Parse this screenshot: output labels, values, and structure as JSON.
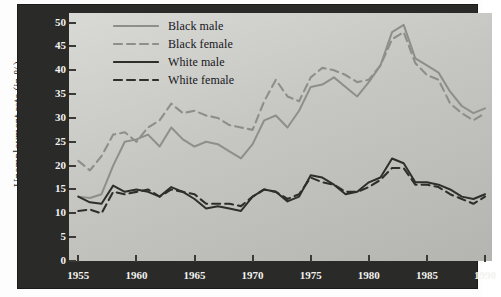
{
  "chart_data": {
    "type": "line",
    "title": "",
    "xlabel": "",
    "ylabel": "Unemployment rate (in %)",
    "xlim": [
      1954.2,
      1990.6
    ],
    "ylim": [
      0,
      52
    ],
    "xticks": [
      1955,
      1960,
      1965,
      1970,
      1975,
      1980,
      1985,
      1990
    ],
    "yticks": [
      0,
      5,
      10,
      15,
      20,
      25,
      30,
      35,
      40,
      45,
      50
    ],
    "grid": false,
    "legend_position": "top-left-inside",
    "x": [
      1955,
      1956,
      1957,
      1958,
      1959,
      1960,
      1961,
      1962,
      1963,
      1964,
      1965,
      1966,
      1967,
      1968,
      1969,
      1970,
      1971,
      1972,
      1973,
      1974,
      1975,
      1976,
      1977,
      1978,
      1979,
      1980,
      1981,
      1982,
      1983,
      1984,
      1985,
      1986,
      1987,
      1988,
      1989,
      1990
    ],
    "series": [
      {
        "name": "Black male",
        "color": "#8e8e8b",
        "style": "solid",
        "values": [
          13.5,
          13.2,
          14.0,
          20.0,
          25.0,
          25.5,
          26.5,
          24.0,
          28.0,
          25.5,
          24.0,
          25.0,
          24.5,
          23.0,
          21.5,
          24.5,
          29.5,
          30.5,
          28.0,
          31.5,
          36.5,
          37.0,
          38.5,
          36.5,
          34.5,
          37.5,
          41.0,
          48.0,
          49.5,
          42.5,
          41.0,
          39.5,
          35.5,
          32.5,
          31.0,
          32.0
        ]
      },
      {
        "name": "Black female",
        "color": "#8e8e8b",
        "style": "dashed",
        "values": [
          21.0,
          19.0,
          22.0,
          26.5,
          27.0,
          25.0,
          28.0,
          29.5,
          33.0,
          31.0,
          31.5,
          30.5,
          30.0,
          28.5,
          28.0,
          27.5,
          33.5,
          38.0,
          34.5,
          33.5,
          38.5,
          40.5,
          40.0,
          39.0,
          37.5,
          38.0,
          41.0,
          46.5,
          48.0,
          41.5,
          39.0,
          38.0,
          33.0,
          31.0,
          29.5,
          31.0
        ]
      },
      {
        "name": "White male",
        "color": "#2e2e2c",
        "style": "solid",
        "values": [
          13.5,
          12.3,
          12.0,
          15.8,
          14.5,
          15.0,
          14.5,
          13.5,
          15.5,
          14.5,
          13.0,
          11.0,
          11.5,
          11.0,
          10.5,
          13.5,
          15.0,
          14.5,
          12.5,
          13.5,
          18.0,
          17.5,
          16.0,
          14.0,
          14.5,
          16.5,
          17.5,
          21.5,
          20.5,
          16.5,
          16.5,
          16.0,
          15.0,
          13.5,
          13.0,
          14.0
        ]
      },
      {
        "name": "White female",
        "color": "#2e2e2c",
        "style": "dashed",
        "values": [
          10.5,
          10.8,
          10.0,
          14.5,
          14.0,
          14.5,
          15.0,
          13.5,
          15.0,
          14.5,
          14.0,
          12.0,
          12.0,
          12.0,
          11.5,
          13.5,
          15.0,
          14.5,
          13.0,
          14.0,
          17.5,
          16.5,
          16.0,
          14.5,
          14.5,
          15.5,
          17.0,
          19.5,
          19.5,
          16.0,
          16.0,
          15.5,
          14.0,
          13.0,
          12.0,
          13.5
        ]
      }
    ]
  },
  "axis": {
    "ylabel": "Unemployment rate (in %)",
    "ytick_labels": [
      "50",
      "45",
      "40",
      "35",
      "30",
      "25",
      "20",
      "15",
      "10",
      "5",
      "0"
    ],
    "xtick_labels": [
      "1955",
      "1960",
      "1965",
      "1970",
      "1975",
      "1980",
      "1985",
      "1990"
    ]
  },
  "legend": {
    "items": [
      {
        "label": "Black male",
        "color": "#8e8e8b",
        "style": "solid"
      },
      {
        "label": "Black female",
        "color": "#8e8e8b",
        "style": "dashed"
      },
      {
        "label": "White male",
        "color": "#2e2e2c",
        "style": "solid"
      },
      {
        "label": "White female",
        "color": "#2e2e2c",
        "style": "dashed"
      }
    ]
  },
  "colors": {
    "frame": "#2a2a28",
    "plot_light": "#d9d9d6",
    "plot_dark": "#b4b4b1",
    "tick_text": "#f2f2ef",
    "black_group": "#8e8e8b",
    "white_group": "#2e2e2c"
  }
}
